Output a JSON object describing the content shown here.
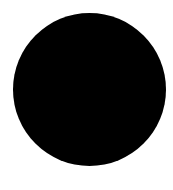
{
  "canvas": {
    "background_color": "#ffffff"
  },
  "shape": {
    "type": "circle",
    "fill_color": "#000000"
  }
}
